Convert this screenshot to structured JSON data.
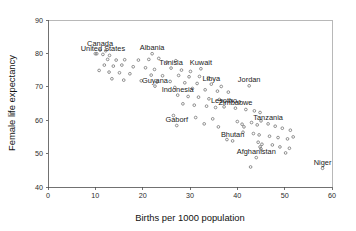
{
  "chart_data": {
    "type": "scatter",
    "title": "",
    "xlabel": "Births per 1000 population",
    "ylabel": "Female life expectancy",
    "xlim": [
      0,
      60
    ],
    "ylim": [
      40,
      90
    ],
    "xticks": [
      0,
      10,
      20,
      30,
      40,
      50,
      60
    ],
    "yticks": [
      40,
      50,
      60,
      70,
      80,
      90
    ],
    "grid": false,
    "legend": "none",
    "marker": "open-circle",
    "marker_color": "#6e6e6e",
    "axis_color": "#4d4d4d",
    "frame_color": "#9a9a9a",
    "points": [
      {
        "x": 11.0,
        "y": 81.0,
        "label": "Canada"
      },
      {
        "x": 12.2,
        "y": 80.8,
        "label": ""
      },
      {
        "x": 10.3,
        "y": 79.9,
        "label": ""
      },
      {
        "x": 11.6,
        "y": 79.7,
        "label": "United States"
      },
      {
        "x": 10.0,
        "y": 79.9,
        "label": ""
      },
      {
        "x": 13.0,
        "y": 79.4,
        "label": ""
      },
      {
        "x": 22.0,
        "y": 79.9,
        "label": "Albania"
      },
      {
        "x": 12.6,
        "y": 78.2,
        "label": ""
      },
      {
        "x": 14.4,
        "y": 78.0,
        "label": ""
      },
      {
        "x": 16.2,
        "y": 78.1,
        "label": ""
      },
      {
        "x": 19.1,
        "y": 78.0,
        "label": ""
      },
      {
        "x": 21.3,
        "y": 78.2,
        "label": ""
      },
      {
        "x": 23.4,
        "y": 78.5,
        "label": ""
      },
      {
        "x": 25.1,
        "y": 77.4,
        "label": ""
      },
      {
        "x": 27.0,
        "y": 77.8,
        "label": ""
      },
      {
        "x": 11.9,
        "y": 76.5,
        "label": ""
      },
      {
        "x": 13.8,
        "y": 76.2,
        "label": ""
      },
      {
        "x": 15.6,
        "y": 76.5,
        "label": ""
      },
      {
        "x": 18.0,
        "y": 76.0,
        "label": ""
      },
      {
        "x": 20.6,
        "y": 75.7,
        "label": ""
      },
      {
        "x": 22.5,
        "y": 75.2,
        "label": ""
      },
      {
        "x": 26.0,
        "y": 75.6,
        "label": "Tunisia"
      },
      {
        "x": 28.2,
        "y": 75.0,
        "label": ""
      },
      {
        "x": 30.1,
        "y": 74.6,
        "label": ""
      },
      {
        "x": 32.3,
        "y": 75.4,
        "label": "Kuwait"
      },
      {
        "x": 10.8,
        "y": 74.9,
        "label": ""
      },
      {
        "x": 12.9,
        "y": 74.4,
        "label": ""
      },
      {
        "x": 15.1,
        "y": 74.2,
        "label": ""
      },
      {
        "x": 17.3,
        "y": 73.9,
        "label": ""
      },
      {
        "x": 21.8,
        "y": 73.5,
        "label": ""
      },
      {
        "x": 24.2,
        "y": 73.3,
        "label": ""
      },
      {
        "x": 27.6,
        "y": 73.4,
        "label": ""
      },
      {
        "x": 29.8,
        "y": 73.0,
        "label": ""
      },
      {
        "x": 32.0,
        "y": 73.1,
        "label": ""
      },
      {
        "x": 33.9,
        "y": 72.5,
        "label": ""
      },
      {
        "x": 13.5,
        "y": 72.4,
        "label": ""
      },
      {
        "x": 16.0,
        "y": 72.0,
        "label": ""
      },
      {
        "x": 19.7,
        "y": 71.8,
        "label": ""
      },
      {
        "x": 23.0,
        "y": 71.4,
        "label": ""
      },
      {
        "x": 25.8,
        "y": 71.6,
        "label": ""
      },
      {
        "x": 28.9,
        "y": 71.2,
        "label": ""
      },
      {
        "x": 31.5,
        "y": 71.0,
        "label": ""
      },
      {
        "x": 34.5,
        "y": 70.8,
        "label": "Libya"
      },
      {
        "x": 36.6,
        "y": 70.1,
        "label": ""
      },
      {
        "x": 22.6,
        "y": 70.2,
        "label": "Guyana"
      },
      {
        "x": 26.8,
        "y": 69.8,
        "label": ""
      },
      {
        "x": 30.5,
        "y": 69.5,
        "label": ""
      },
      {
        "x": 33.2,
        "y": 69.1,
        "label": ""
      },
      {
        "x": 35.8,
        "y": 68.7,
        "label": ""
      },
      {
        "x": 38.1,
        "y": 68.4,
        "label": ""
      },
      {
        "x": 42.5,
        "y": 70.3,
        "label": "Jordan"
      },
      {
        "x": 27.4,
        "y": 67.5,
        "label": "Indonesia"
      },
      {
        "x": 29.6,
        "y": 67.1,
        "label": ""
      },
      {
        "x": 31.8,
        "y": 66.9,
        "label": ""
      },
      {
        "x": 34.0,
        "y": 66.4,
        "label": ""
      },
      {
        "x": 36.2,
        "y": 66.2,
        "label": ""
      },
      {
        "x": 38.5,
        "y": 65.8,
        "label": ""
      },
      {
        "x": 40.4,
        "y": 65.4,
        "label": ""
      },
      {
        "x": 28.5,
        "y": 64.9,
        "label": ""
      },
      {
        "x": 30.9,
        "y": 64.5,
        "label": ""
      },
      {
        "x": 33.5,
        "y": 64.2,
        "label": ""
      },
      {
        "x": 35.4,
        "y": 63.8,
        "label": ""
      },
      {
        "x": 37.2,
        "y": 64.0,
        "label": "Lesotho"
      },
      {
        "x": 39.6,
        "y": 63.6,
        "label": "Zimbabwe"
      },
      {
        "x": 41.8,
        "y": 63.2,
        "label": ""
      },
      {
        "x": 43.6,
        "y": 62.8,
        "label": ""
      },
      {
        "x": 44.8,
        "y": 62.3,
        "label": ""
      },
      {
        "x": 26.5,
        "y": 61.4,
        "label": ""
      },
      {
        "x": 31.2,
        "y": 60.8,
        "label": ""
      },
      {
        "x": 34.8,
        "y": 60.4,
        "label": ""
      },
      {
        "x": 27.2,
        "y": 58.4,
        "label": "Gaborf"
      },
      {
        "x": 33.0,
        "y": 58.9,
        "label": ""
      },
      {
        "x": 36.0,
        "y": 58.0,
        "label": ""
      },
      {
        "x": 40.0,
        "y": 59.6,
        "label": ""
      },
      {
        "x": 41.0,
        "y": 58.8,
        "label": ""
      },
      {
        "x": 41.4,
        "y": 58.0,
        "label": ""
      },
      {
        "x": 43.0,
        "y": 59.3,
        "label": ""
      },
      {
        "x": 44.2,
        "y": 58.6,
        "label": ""
      },
      {
        "x": 45.0,
        "y": 59.8,
        "label": ""
      },
      {
        "x": 46.5,
        "y": 58.9,
        "label": "Tanzania"
      },
      {
        "x": 48.0,
        "y": 58.2,
        "label": ""
      },
      {
        "x": 49.5,
        "y": 57.6,
        "label": ""
      },
      {
        "x": 51.2,
        "y": 57.0,
        "label": ""
      },
      {
        "x": 41.2,
        "y": 56.4,
        "label": ""
      },
      {
        "x": 43.4,
        "y": 56.0,
        "label": ""
      },
      {
        "x": 44.6,
        "y": 55.6,
        "label": ""
      },
      {
        "x": 46.8,
        "y": 55.2,
        "label": ""
      },
      {
        "x": 48.6,
        "y": 54.8,
        "label": ""
      },
      {
        "x": 50.6,
        "y": 54.4,
        "label": ""
      },
      {
        "x": 51.8,
        "y": 55.0,
        "label": ""
      },
      {
        "x": 37.8,
        "y": 54.2,
        "label": ""
      },
      {
        "x": 39.0,
        "y": 53.8,
        "label": "Bhutan"
      },
      {
        "x": 44.4,
        "y": 53.4,
        "label": ""
      },
      {
        "x": 45.2,
        "y": 52.8,
        "label": ""
      },
      {
        "x": 44.8,
        "y": 52.0,
        "label": ""
      },
      {
        "x": 45.0,
        "y": 51.4,
        "label": ""
      },
      {
        "x": 47.4,
        "y": 52.6,
        "label": ""
      },
      {
        "x": 49.0,
        "y": 52.0,
        "label": ""
      },
      {
        "x": 51.0,
        "y": 51.6,
        "label": ""
      },
      {
        "x": 50.2,
        "y": 50.2,
        "label": ""
      },
      {
        "x": 44.0,
        "y": 48.8,
        "label": "Afghanistan"
      },
      {
        "x": 42.8,
        "y": 46.0,
        "label": ""
      },
      {
        "x": 58.0,
        "y": 45.6,
        "label": "Niger"
      }
    ]
  }
}
